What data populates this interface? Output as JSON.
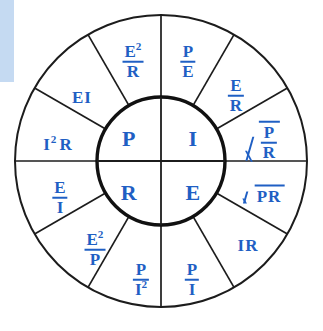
{
  "diagram": {
    "name": "ohms-law-wheel",
    "accent_color": "#c5daf2",
    "text_color": "#1f5fc4",
    "line_color": "#1c1c1c",
    "background": "#ffffff",
    "geometry": {
      "center_x": 161,
      "center_y": 161,
      "outer_radius": 147,
      "inner_radius": 64,
      "outer_segments": 12,
      "inner_segments": 4,
      "segment_degrees": 30
    }
  },
  "inner": {
    "quadrants": [
      {
        "key": "power",
        "label": "P",
        "position": "top-left"
      },
      {
        "key": "current",
        "label": "I",
        "position": "top-right"
      },
      {
        "key": "resistance",
        "label": "R",
        "position": "bottom-left"
      },
      {
        "key": "voltage",
        "label": "E",
        "position": "bottom-right"
      }
    ]
  },
  "outer": {
    "segments": [
      {
        "key": "p-over-e",
        "type": "fraction",
        "numerator": "P",
        "denominator": "E",
        "quadrant": "power"
      },
      {
        "key": "e-over-r",
        "type": "fraction",
        "numerator": "E",
        "denominator": "R",
        "quadrant": "current"
      },
      {
        "key": "sqrt-p-over-r",
        "type": "radical-fraction",
        "numerator": "P",
        "denominator": "R",
        "quadrant": "current"
      },
      {
        "key": "sqrt-pr",
        "type": "radical",
        "body": "PR",
        "quadrant": "voltage"
      },
      {
        "key": "ir",
        "type": "plain",
        "body": "IR",
        "quadrant": "voltage"
      },
      {
        "key": "p-over-i",
        "type": "fraction",
        "numerator": "P",
        "denominator": "I",
        "quadrant": "voltage"
      },
      {
        "key": "p-over-i2",
        "type": "fraction",
        "numerator": "P",
        "denominator": "I",
        "denominator_exponent": "2",
        "quadrant": "resistance"
      },
      {
        "key": "e2-over-p",
        "type": "fraction",
        "numerator": "E",
        "numerator_exponent": "2",
        "denominator": "P",
        "quadrant": "resistance"
      },
      {
        "key": "e-over-i",
        "type": "fraction",
        "numerator": "E",
        "denominator": "I",
        "quadrant": "resistance"
      },
      {
        "key": "i2r",
        "type": "plain",
        "body": "I",
        "exponent": "2",
        "body_tail": "R",
        "quadrant": "power"
      },
      {
        "key": "ei",
        "type": "plain",
        "body": "EI",
        "quadrant": "power"
      },
      {
        "key": "e2-over-r",
        "type": "fraction",
        "numerator": "E",
        "numerator_exponent": "2",
        "denominator": "R",
        "quadrant": "power"
      }
    ]
  },
  "labels": {
    "p": "P",
    "i": "I",
    "r": "R",
    "e": "E",
    "two": "2",
    "ei": "EI",
    "ir": "IR",
    "pr": "PR"
  }
}
